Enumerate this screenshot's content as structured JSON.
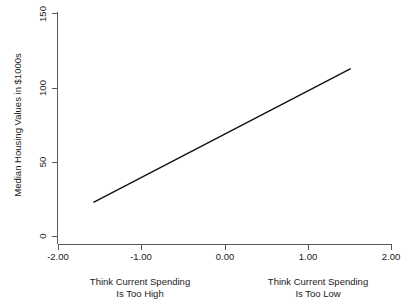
{
  "chart_data": {
    "type": "line",
    "title": "",
    "subtitle": "",
    "xlabel": "",
    "ylabel": "Median Housing Values in $1000s",
    "xlim": [
      -2.0,
      2.0
    ],
    "ylim": [
      0,
      150
    ],
    "grid": false,
    "legend": "none",
    "x_ticks": [
      "-2.00",
      "-1.00",
      "0.00",
      "1.00",
      "2.00"
    ],
    "x_tick_values": [
      -2.0,
      -1.0,
      0.0,
      1.0,
      2.0
    ],
    "y_ticks": [
      "0",
      "50",
      "100",
      "150"
    ],
    "y_tick_values": [
      0,
      50,
      100,
      150
    ],
    "series": [
      {
        "name": "Median Housing Values",
        "x": [
          -1.58,
          1.51
        ],
        "values": [
          23,
          113
        ],
        "color": "#101010"
      }
    ],
    "annotations": [
      {
        "name": "left-axis-caption",
        "line1": "Think Current Spending",
        "line2": "Is Too High",
        "x": -1.25
      },
      {
        "name": "right-axis-caption",
        "line1": "Think Current Spending",
        "line2": "Is Too Low",
        "x": 1.0
      }
    ]
  },
  "axes": {
    "y_title": "Median Housing Values in $1000s",
    "y_tick_0": "0",
    "y_tick_1": "50",
    "y_tick_2": "100",
    "y_tick_3": "150",
    "x_tick_0": "-2.00",
    "x_tick_1": "-1.00",
    "x_tick_2": "0.00",
    "x_tick_3": "1.00",
    "x_tick_4": "2.00"
  },
  "captions": {
    "left_line1": "Think Current Spending",
    "left_line2": "Is Too High",
    "right_line1": "Think Current Spending",
    "right_line2": "Is Too Low"
  }
}
